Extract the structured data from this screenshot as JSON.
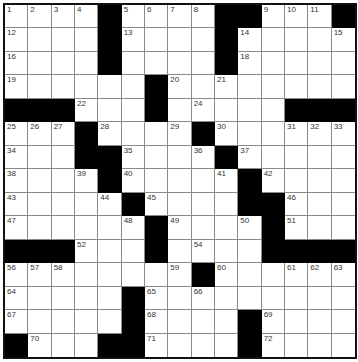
{
  "puzzle": {
    "rows": 15,
    "cols": 15,
    "grid": [
      ".....#....##...#",
      "....#....#.....",
      "....#....#.....",
      "......#........",
      "###...#.....###",
      "...#...#.......",
      "...##...#......",
      "....#....#.....",
      ".....#....##...",
      "......#...#....",
      "###...#.....###",
      "........#......",
      ".....#.........",
      ".....#....#....",
      "#...##....#...."
    ],
    "numbers": [
      [
        0,
        0,
        "1"
      ],
      [
        0,
        1,
        "2"
      ],
      [
        0,
        2,
        "3"
      ],
      [
        0,
        3,
        "4"
      ],
      [
        0,
        5,
        "5"
      ],
      [
        0,
        6,
        "6"
      ],
      [
        0,
        7,
        "7"
      ],
      [
        0,
        8,
        "8"
      ],
      [
        0,
        11,
        "9"
      ],
      [
        0,
        12,
        "10"
      ],
      [
        0,
        13,
        "11"
      ],
      [
        1,
        0,
        "12"
      ],
      [
        1,
        5,
        "13"
      ],
      [
        1,
        10,
        "14"
      ],
      [
        1,
        14,
        "15"
      ],
      [
        2,
        0,
        "16"
      ],
      [
        2,
        4,
        "17"
      ],
      [
        2,
        10,
        "18"
      ],
      [
        3,
        0,
        "19"
      ],
      [
        3,
        7,
        "20"
      ],
      [
        3,
        9,
        "21"
      ],
      [
        4,
        3,
        "22"
      ],
      [
        4,
        6,
        "23"
      ],
      [
        4,
        8,
        "24"
      ],
      [
        5,
        0,
        "25"
      ],
      [
        5,
        1,
        "26"
      ],
      [
        5,
        2,
        "27"
      ],
      [
        5,
        4,
        "28"
      ],
      [
        5,
        7,
        "29"
      ],
      [
        5,
        9,
        "30"
      ],
      [
        5,
        12,
        "31"
      ],
      [
        5,
        13,
        "32"
      ],
      [
        5,
        14,
        "33"
      ],
      [
        6,
        0,
        "34"
      ],
      [
        6,
        5,
        "35"
      ],
      [
        6,
        8,
        "36"
      ],
      [
        6,
        10,
        "37"
      ],
      [
        7,
        0,
        "38"
      ],
      [
        7,
        3,
        "39"
      ],
      [
        7,
        5,
        "40"
      ],
      [
        7,
        9,
        "41"
      ],
      [
        7,
        11,
        "42"
      ],
      [
        8,
        0,
        "43"
      ],
      [
        8,
        4,
        "44"
      ],
      [
        8,
        6,
        "45"
      ],
      [
        8,
        12,
        "46"
      ],
      [
        9,
        0,
        "47"
      ],
      [
        9,
        5,
        "48"
      ],
      [
        9,
        7,
        "49"
      ],
      [
        9,
        10,
        "50"
      ],
      [
        9,
        12,
        "51"
      ],
      [
        10,
        3,
        "52"
      ],
      [
        10,
        6,
        "53"
      ],
      [
        10,
        8,
        "54"
      ],
      [
        10,
        11,
        "55"
      ],
      [
        11,
        0,
        "56"
      ],
      [
        11,
        1,
        "57"
      ],
      [
        11,
        2,
        "58"
      ],
      [
        11,
        7,
        "59"
      ],
      [
        11,
        9,
        "60"
      ],
      [
        11,
        12,
        "61"
      ],
      [
        11,
        13,
        "62"
      ],
      [
        11,
        14,
        "63"
      ],
      [
        12,
        0,
        "64"
      ],
      [
        12,
        6,
        "65"
      ],
      [
        12,
        8,
        "66"
      ],
      [
        13,
        0,
        "67"
      ],
      [
        13,
        6,
        "68"
      ],
      [
        13,
        11,
        "69"
      ],
      [
        14,
        1,
        "70"
      ],
      [
        14,
        6,
        "71"
      ],
      [
        14,
        11,
        "72"
      ]
    ],
    "colors": {
      "block": "#000000",
      "cell": "#ffffff",
      "line": "#8a8a8a"
    }
  }
}
